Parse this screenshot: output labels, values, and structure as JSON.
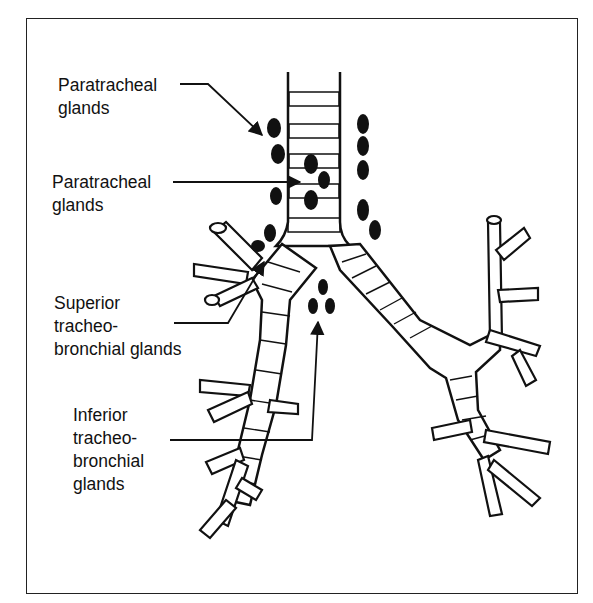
{
  "diagram": {
    "type": "anatomical illustration",
    "labels": [
      {
        "id": "paratracheal-1",
        "line1": "Paratracheal",
        "line2": "glands"
      },
      {
        "id": "paratracheal-2",
        "line1": "Paratracheal",
        "line2": "glands"
      },
      {
        "id": "superior",
        "line1": "Superior",
        "line2": "tracheo-",
        "line3": "bronchial glands"
      },
      {
        "id": "inferior",
        "line1": "Inferior",
        "line2": "tracheo-",
        "line3": "bronchial",
        "line4": "glands"
      }
    ],
    "colors": {
      "ink": "#111111",
      "background": "#ffffff"
    }
  }
}
